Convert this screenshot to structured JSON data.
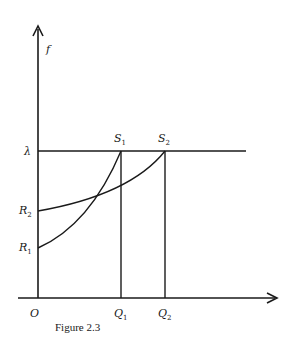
{
  "figure": {
    "caption": "Figure 2.3",
    "y_axis_label": "f",
    "origin_label": "O",
    "lambda_label": "λ",
    "points": {
      "S1": {
        "main": "S",
        "sub": "1"
      },
      "S2": {
        "main": "S",
        "sub": "2"
      },
      "R1": {
        "main": "R",
        "sub": "1"
      },
      "R2": {
        "main": "R",
        "sub": "2"
      },
      "Q1": {
        "main": "Q",
        "sub": "1"
      },
      "Q2": {
        "main": "Q",
        "sub": "2"
      }
    }
  },
  "colors": {
    "ink": "#1a1a1a",
    "background": "#ffffff"
  }
}
